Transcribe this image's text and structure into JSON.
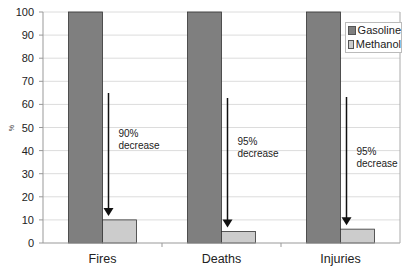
{
  "chart_data": {
    "type": "bar",
    "title": "",
    "xlabel": "",
    "ylabel": "%",
    "ylim": [
      0,
      100
    ],
    "yticks": [
      0,
      10,
      20,
      30,
      40,
      50,
      60,
      70,
      80,
      90,
      100
    ],
    "grid": true,
    "legend_position": "upper right",
    "categories": [
      "Fires",
      "Deaths",
      "Injuries"
    ],
    "series": [
      {
        "name": "Gasoline",
        "values": [
          100,
          100,
          100
        ],
        "color": "#7f7f7f"
      },
      {
        "name": "Methanol",
        "values": [
          10,
          5,
          6
        ],
        "color": "#cccccc"
      }
    ],
    "annotations": [
      {
        "category": "Fires",
        "line1": "90%",
        "line2": "decrease"
      },
      {
        "category": "Deaths",
        "line1": "95%",
        "line2": "decrease"
      },
      {
        "category": "Injuries",
        "line1": "95%",
        "line2": "decrease"
      }
    ]
  },
  "legend": {
    "items": [
      {
        "label": "Gasoline",
        "color": "#7f7f7f"
      },
      {
        "label": "Methanol",
        "color": "#cccccc"
      }
    ]
  }
}
